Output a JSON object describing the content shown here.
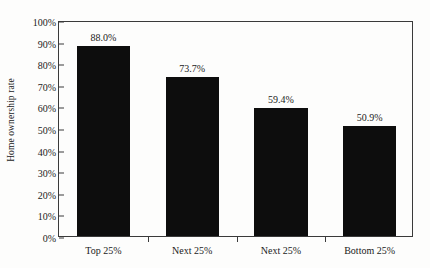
{
  "chart_data": {
    "type": "bar",
    "title": "",
    "xlabel": "",
    "ylabel": "Home ownership rate",
    "categories": [
      "Top 25%",
      "Next 25%",
      "Next 25%",
      "Bottom 25%"
    ],
    "values": [
      88.0,
      73.7,
      59.4,
      50.9
    ],
    "value_labels": [
      "88.0%",
      "73.7%",
      "59.4%",
      "50.9%"
    ],
    "ylim": [
      0,
      100
    ],
    "ytick_labels": [
      "100%",
      "90%",
      "80%",
      "70%",
      "60%",
      "50%",
      "40%",
      "30%",
      "20%",
      "10%",
      "0%"
    ],
    "ytick_values": [
      100,
      90,
      80,
      70,
      60,
      50,
      40,
      30,
      20,
      10,
      0
    ],
    "grid": false,
    "legend": null,
    "bar_color": "#0d0d0d",
    "axis_color": "#3a3a3a",
    "background_color": "#fdfdfc"
  }
}
